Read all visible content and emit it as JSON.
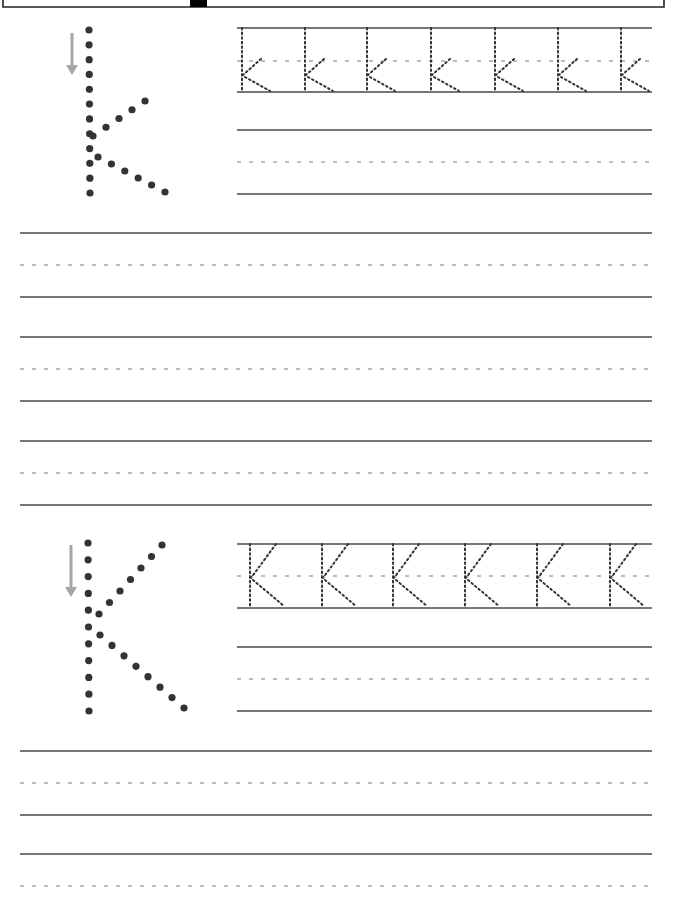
{
  "worksheet": {
    "title": "Letter K handwriting practice",
    "colors": {
      "line": "#4a4a4a",
      "dash": "#a8a8a8",
      "dot": "#333333",
      "arrow": "#a6a6a6",
      "background": "#ffffff"
    },
    "header_box": {
      "left": 3,
      "right": 664,
      "bottom": 7,
      "tab_x": 190,
      "tab_w": 17
    },
    "sections": [
      {
        "id": "lowercase",
        "letter": "k",
        "model": {
          "stem": {
            "x": 89,
            "y_top": 30,
            "y_bottom": 193,
            "count": 12
          },
          "arm": {
            "from": [
              93,
              136
            ],
            "to": [
              145,
              101
            ],
            "count": 5
          },
          "leg": {
            "from": [
              98,
              157
            ],
            "to": [
              165,
              192
            ],
            "count": 6
          },
          "arrow": {
            "x": 72,
            "y_top": 33,
            "y_bottom": 75
          }
        },
        "trace_row": {
          "top": 28,
          "mid": 61,
          "base": 92,
          "left": 237,
          "right": 652,
          "letter_x": [
            242,
            305,
            367,
            431,
            495,
            558,
            621
          ],
          "glyph": "k"
        },
        "practice_rows": [
          {
            "top": 130,
            "mid": 162,
            "base": 194,
            "left": 237,
            "right": 652
          }
        ]
      },
      {
        "id": "uppercase",
        "letter": "K",
        "model": {
          "stem": {
            "x": 88,
            "y_top": 543,
            "y_bottom": 711,
            "count": 11
          },
          "arm": {
            "from": [
              99,
              614
            ],
            "to": [
              162,
              545
            ],
            "count": 7
          },
          "leg": {
            "from": [
              100,
              635
            ],
            "to": [
              184,
              708
            ],
            "count": 8
          },
          "arrow": {
            "x": 71,
            "y_top": 545,
            "y_bottom": 597
          }
        },
        "trace_row": {
          "top": 544,
          "mid": 576,
          "base": 608,
          "left": 237,
          "right": 652,
          "letter_x": [
            250,
            322,
            393,
            465,
            537,
            610
          ],
          "glyph": "K"
        },
        "practice_rows": [
          {
            "top": 647,
            "mid": 679,
            "base": 711,
            "left": 237,
            "right": 652
          }
        ]
      }
    ],
    "full_rows": [
      {
        "top": 233,
        "mid": 265,
        "base": 297
      },
      {
        "top": 337,
        "mid": 369,
        "base": 401
      },
      {
        "top": 441,
        "mid": 473,
        "base": 505
      },
      {
        "top": 751,
        "mid": 783,
        "base": 815
      },
      {
        "top": 854,
        "mid": 886,
        "base": null
      }
    ],
    "full_row_extent": {
      "left": 20,
      "right": 652
    }
  }
}
